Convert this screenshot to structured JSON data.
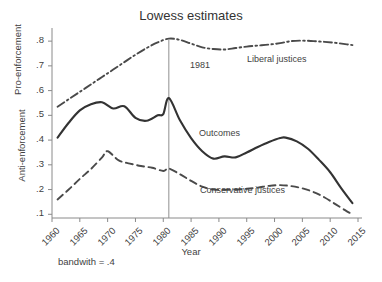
{
  "chart_data": {
    "type": "line",
    "title": "Lowess estimates",
    "subtitle": "",
    "xlabel": "Year",
    "ylabel_upper": "Pro-enforcement",
    "ylabel_lower": "Anti-enforcement",
    "note": "bandwith = .4",
    "xlim": [
      1960,
      2015
    ],
    "ylim": [
      0.085,
      0.845
    ],
    "grid": false,
    "legend_position": "inline-labels",
    "xticks": [
      "1960",
      "1965",
      "1970",
      "1975",
      "1980",
      "1985",
      "1990",
      "1995",
      "2000",
      "2005",
      "2010",
      "2015"
    ],
    "xtick_values": [
      1960,
      1965,
      1970,
      1975,
      1980,
      1985,
      1990,
      1995,
      2000,
      2005,
      2010,
      2015
    ],
    "yticks": [
      ".1",
      ".2",
      ".3",
      ".4",
      ".5",
      ".6",
      ".7",
      ".8"
    ],
    "ytick_values": [
      0.1,
      0.2,
      0.3,
      0.4,
      0.5,
      0.6,
      0.7,
      0.8
    ],
    "annotations": [
      {
        "name": "reference-line-1981",
        "label": "1981",
        "x": 1981,
        "type": "vertical-line"
      }
    ],
    "series": [
      {
        "name": "Liberal justices",
        "style": "dash-dot",
        "color": "#4a4a4a",
        "x": [
          1961,
          1963,
          1965,
          1967,
          1969,
          1971,
          1973,
          1975,
          1977,
          1979,
          1981,
          1983,
          1985,
          1987,
          1989,
          1991,
          1993,
          1995,
          1997,
          1999,
          2001,
          2003,
          2005,
          2007,
          2009,
          2011,
          2013,
          2014
        ],
        "values": [
          0.535,
          0.565,
          0.595,
          0.625,
          0.655,
          0.685,
          0.715,
          0.745,
          0.772,
          0.795,
          0.81,
          0.805,
          0.79,
          0.775,
          0.768,
          0.766,
          0.772,
          0.778,
          0.782,
          0.786,
          0.792,
          0.8,
          0.802,
          0.8,
          0.797,
          0.793,
          0.787,
          0.784
        ]
      },
      {
        "name": "Outcomes",
        "style": "solid",
        "color": "#333333",
        "x": [
          1961,
          1963,
          1965,
          1967,
          1969,
          1971,
          1973,
          1975,
          1977,
          1979,
          1980,
          1981,
          1983,
          1985,
          1987,
          1989,
          1991,
          1993,
          1995,
          1997,
          1999,
          2001,
          2002,
          2004,
          2006,
          2008,
          2010,
          2012,
          2014
        ],
        "values": [
          0.41,
          0.47,
          0.52,
          0.545,
          0.553,
          0.528,
          0.537,
          0.49,
          0.478,
          0.5,
          0.505,
          0.57,
          0.48,
          0.408,
          0.355,
          0.325,
          0.334,
          0.33,
          0.35,
          0.372,
          0.392,
          0.408,
          0.41,
          0.395,
          0.365,
          0.32,
          0.27,
          0.205,
          0.145
        ]
      },
      {
        "name": "Conservative justices",
        "style": "dashed",
        "color": "#4a4a4a",
        "x": [
          1961,
          1963,
          1965,
          1967,
          1969,
          1970,
          1972,
          1974,
          1976,
          1978,
          1980,
          1981,
          1983,
          1985,
          1987,
          1989,
          1991,
          1993,
          1995,
          1997,
          1999,
          2001,
          2003,
          2005,
          2007,
          2009,
          2011,
          2013,
          2014
        ],
        "values": [
          0.16,
          0.2,
          0.243,
          0.283,
          0.33,
          0.355,
          0.318,
          0.305,
          0.295,
          0.288,
          0.275,
          0.285,
          0.262,
          0.235,
          0.212,
          0.2,
          0.199,
          0.2,
          0.203,
          0.208,
          0.215,
          0.218,
          0.214,
          0.205,
          0.19,
          0.168,
          0.14,
          0.112,
          0.1
        ]
      }
    ]
  }
}
